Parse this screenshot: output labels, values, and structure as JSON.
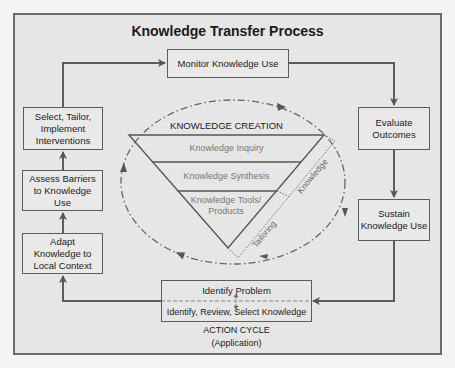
{
  "title": "Knowledge Transfer Process",
  "action_cycle": {
    "monitor": "Monitor Knowledge Use",
    "evaluate": "Evaluate Outcomes",
    "sustain": "Sustain Knowledge Use",
    "identify_problem": "Identify Problem",
    "identify_review": "Identify, Review, Select Knowledge",
    "adapt": "Adapt Knowledge to Local Context",
    "assess": "Assess Barriers to Knowledge Use",
    "select": "Select, Tailor, Implement Interventions",
    "label": "ACTION CYCLE",
    "sublabel": "(Application)"
  },
  "knowledge_creation": {
    "heading": "KNOWLEDGE CREATION",
    "bands": [
      "Knowledge Inquiry",
      "Knowledge Synthesis",
      "Knowledge Tools/ Products"
    ],
    "side_labels": [
      "Tailoring",
      "Knowledge"
    ]
  },
  "colors": {
    "line": "#5c5c5c",
    "background": "#e6e6e6",
    "band_text": "#777777"
  }
}
